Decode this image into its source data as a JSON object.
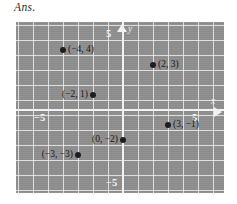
{
  "heading": {
    "text": "Ans."
  },
  "graph": {
    "axis_labels": {
      "x": "x",
      "y": "y"
    },
    "tick_labels": {
      "y_top": "5",
      "y_bottom": "−5",
      "x_left": "−5",
      "x_right": "5"
    },
    "colors": {
      "plot_background": "#8e8e8e",
      "gridline": "#eeeeee",
      "axis": "#f4f4f4",
      "point": "#1a1a1a",
      "point_label": "#121212",
      "page_background": "#ffffff",
      "heading_text": "#2b2b2b"
    }
  },
  "chart_data": {
    "type": "scatter",
    "title": "Ans.",
    "xlabel": "x",
    "ylabel": "y",
    "xlim": [
      -7,
      7
    ],
    "ylim": [
      -6,
      6
    ],
    "xticks": [
      -5,
      5
    ],
    "yticks": [
      -5,
      5
    ],
    "xtick_labels": [
      "−5",
      "5"
    ],
    "ytick_labels": [
      "−5",
      "5"
    ],
    "grid": true,
    "grid_step": 1,
    "legend": null,
    "points": [
      {
        "x": -4,
        "y": 4,
        "label": "(−4, 4)",
        "label_side": "right"
      },
      {
        "x": 2,
        "y": 3,
        "label": "(2, 3)",
        "label_side": "right"
      },
      {
        "x": -2,
        "y": 1,
        "label": "(−2, 1)",
        "label_side": "left"
      },
      {
        "x": 3,
        "y": -1,
        "label": "(3, −1)",
        "label_side": "right"
      },
      {
        "x": 0,
        "y": -2,
        "label": "(0, −2)",
        "label_side": "left"
      },
      {
        "x": -3,
        "y": -3,
        "label": "(−3, −3)",
        "label_side": "left"
      }
    ]
  }
}
